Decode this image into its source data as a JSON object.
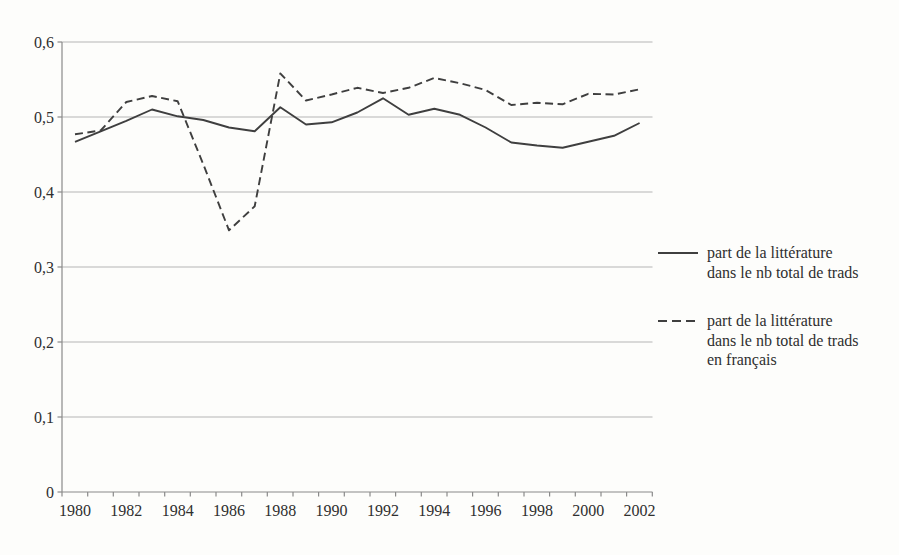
{
  "chart_data": {
    "type": "line",
    "title": "",
    "xlabel": "",
    "ylabel": "",
    "x": [
      1980,
      1981,
      1982,
      1983,
      1984,
      1985,
      1986,
      1987,
      1988,
      1989,
      1990,
      1991,
      1992,
      1993,
      1994,
      1995,
      1996,
      1997,
      1998,
      1999,
      2000,
      2001,
      2002
    ],
    "x_tick_labels": [
      "1980",
      "1982",
      "1984",
      "1986",
      "1988",
      "1990",
      "1992",
      "1994",
      "1996",
      "1998",
      "2000",
      "2002"
    ],
    "series": [
      {
        "name": "part de la littérature dans le nb total de trads",
        "style": "solid",
        "values": [
          0.467,
          0.481,
          0.495,
          0.51,
          0.501,
          0.496,
          0.486,
          0.481,
          0.513,
          0.49,
          0.493,
          0.506,
          0.525,
          0.503,
          0.511,
          0.503,
          0.486,
          0.466,
          0.462,
          0.459,
          0.467,
          0.475,
          0.492
        ]
      },
      {
        "name": "part de la littérature dans le nb total de trads en français",
        "style": "dashed",
        "values": [
          0.477,
          0.482,
          0.52,
          0.528,
          0.521,
          0.437,
          0.349,
          0.381,
          0.558,
          0.522,
          0.53,
          0.539,
          0.532,
          0.539,
          0.552,
          0.545,
          0.536,
          0.516,
          0.519,
          0.517,
          0.531,
          0.53,
          0.537
        ]
      }
    ],
    "ylim": [
      0,
      0.6
    ],
    "y_ticks": [
      0,
      0.1,
      0.2,
      0.3,
      0.4,
      0.5,
      0.6
    ],
    "y_tick_labels": [
      "0",
      "0,1",
      "0,2",
      "0,3",
      "0,4",
      "0,5",
      "0,6"
    ],
    "grid": true,
    "legend_position": "right"
  },
  "legend": {
    "entries": [
      {
        "marker": "solid-line",
        "lines": [
          "part de la littérature",
          "dans le nb total de trads"
        ]
      },
      {
        "marker": "dashed-line",
        "lines": [
          "part de la littérature",
          "dans le nb total de trads",
          "en français"
        ]
      }
    ]
  },
  "colors": {
    "background": "#fdfdfb",
    "line": "#3f3f3f",
    "grid": "#b5b5b5",
    "axis": "#8a8a8a",
    "text": "#2f2f2f"
  }
}
